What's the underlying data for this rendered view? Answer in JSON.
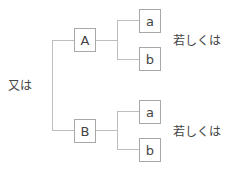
{
  "diagram": {
    "root_label": "又は",
    "branches": [
      {
        "node": "A",
        "children": [
          "a",
          "b"
        ],
        "connector_label": "若しくは"
      },
      {
        "node": "B",
        "children": [
          "a",
          "b"
        ],
        "connector_label": "若しくは"
      }
    ],
    "colors": {
      "line": "#bdbdbd",
      "box_border": "#a8a8a8",
      "text": "#444444"
    }
  }
}
